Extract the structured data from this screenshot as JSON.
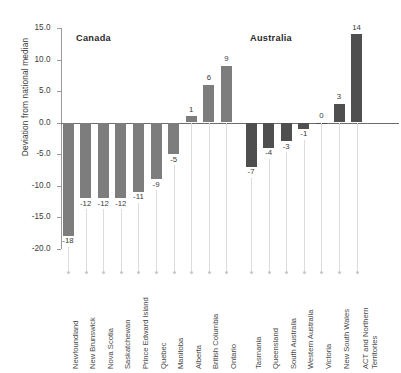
{
  "chart_data": {
    "type": "bar",
    "title": "",
    "xlabel": "",
    "ylabel": "Deviation from national median",
    "ylim": [
      -20.0,
      15.0
    ],
    "ytick_labels": [
      "15.0",
      "10.0",
      "5.0",
      "0.0",
      "-5.0",
      "-10.0",
      "-15.0",
      "-20.0"
    ],
    "ytick_values": [
      15.0,
      10.0,
      5.0,
      0.0,
      -5.0,
      -10.0,
      -15.0,
      -20.0
    ],
    "grid": false,
    "legend": "none",
    "zero_reference_line": true,
    "panels": [
      {
        "name": "Canada",
        "bar_color": "#7d7d7d",
        "categories": [
          "Newfoundland",
          "New Brunswick",
          "Nova Scotia",
          "Saskatchewan",
          "Prince Edward Island",
          "Quebec",
          "Manitoba",
          "Alberta",
          "British Columbia",
          "Ontario"
        ],
        "values": [
          -18,
          -12,
          -12,
          -12,
          -11,
          -9,
          -5,
          1,
          6,
          9
        ],
        "value_labels": [
          "-18",
          "-12",
          "-12",
          "-12",
          "-11",
          "-9",
          "-5",
          "1",
          "6",
          "9"
        ]
      },
      {
        "name": "Australia",
        "bar_color": "#4f4f4f",
        "categories": [
          "Tasmania",
          "Queensland",
          "South Australia",
          "Western Australia",
          "Victoria",
          "New South Wales",
          "ACT and Northern\nTerritories"
        ],
        "values": [
          -7,
          -4,
          -3,
          -1,
          0,
          3,
          14
        ],
        "value_labels": [
          "-7",
          "-4",
          "-3",
          "-1",
          "0",
          "3",
          "14"
        ]
      }
    ]
  },
  "colors": {
    "canada_bar": "#7d7d7d",
    "australia_bar": "#4f4f4f",
    "axis": "#9a9a9a",
    "zero_line": "#6d6d6d",
    "leader": "#dcdcdc",
    "text": "#3b3b3b",
    "background": "#ffffff"
  }
}
